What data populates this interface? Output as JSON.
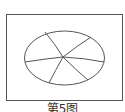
{
  "figure": {
    "caption": "第5图",
    "shape": "ellipse",
    "segments": 6,
    "stroke_color": "#555555",
    "background_color": "#ffffff"
  }
}
